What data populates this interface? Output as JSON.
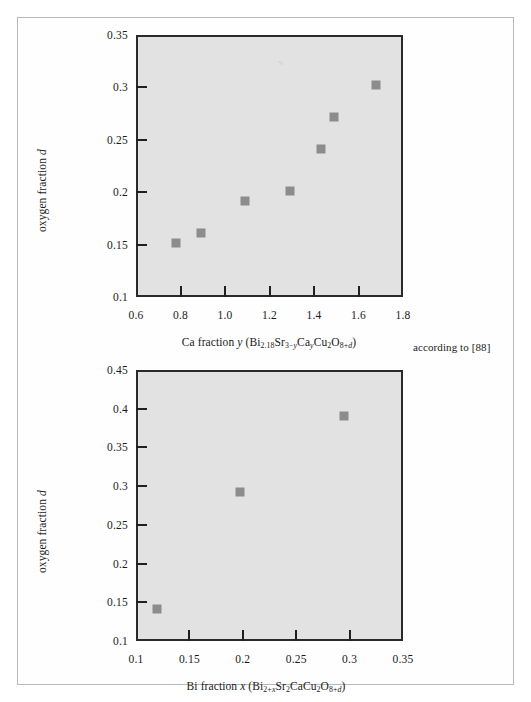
{
  "page": {
    "source_note": "according to [88]"
  },
  "charts": [
    {
      "id": "ca-fraction-plot",
      "axis_x_title_plain": "Ca fraction y (Bi2.18Sr3-yCayCu2O8+d)",
      "axis_y_title_plain": "oxygen fraction d",
      "x_ticks": [
        "0.6",
        "0.8",
        "1.0",
        "1.2",
        "1.4",
        "1.6",
        "1.8"
      ],
      "y_ticks": [
        "0.1",
        "0.15",
        "0.2",
        "0.25",
        "0.3",
        "0.35"
      ]
    },
    {
      "id": "bi-fraction-plot",
      "axis_x_title_plain": "Bi fraction x (Bi2+xSr2CaCu2O8+d)",
      "axis_y_title_plain": "oxygen fraction d",
      "x_ticks": [
        "0.1",
        "0.15",
        "0.2",
        "0.25",
        "0.3",
        "0.35"
      ],
      "y_ticks": [
        "0.1",
        "0.15",
        "0.2",
        "0.25",
        "0.3",
        "0.35",
        "0.4",
        "0.45"
      ]
    }
  ],
  "chart_data": [
    {
      "type": "scatter",
      "title": "",
      "xlabel": "Ca fraction y (Bi2.18Sr3-yCayCu2O8+d)",
      "ylabel": "oxygen fraction d",
      "xlim": [
        0.6,
        1.8
      ],
      "ylim": [
        0.1,
        0.35
      ],
      "xticks": [
        0.6,
        0.8,
        1.0,
        1.2,
        1.4,
        1.6,
        1.8
      ],
      "yticks": [
        0.1,
        0.15,
        0.2,
        0.25,
        0.3,
        0.35
      ],
      "grid": false,
      "legend": false,
      "marker": "square",
      "marker_color": "#8c8c8c",
      "plot_bg": "#e2e2e2",
      "points": [
        {
          "x": 0.78,
          "y": 0.152
        },
        {
          "x": 0.89,
          "y": 0.161
        },
        {
          "x": 1.09,
          "y": 0.192
        },
        {
          "x": 1.29,
          "y": 0.201
        },
        {
          "x": 1.43,
          "y": 0.241
        },
        {
          "x": 1.49,
          "y": 0.272
        },
        {
          "x": 1.68,
          "y": 0.302
        }
      ]
    },
    {
      "type": "scatter",
      "title": "",
      "xlabel": "Bi fraction x (Bi2+xSr2CaCu2O8+d)",
      "ylabel": "oxygen fraction d",
      "xlim": [
        0.1,
        0.35
      ],
      "ylim": [
        0.1,
        0.45
      ],
      "xticks": [
        0.1,
        0.15,
        0.2,
        0.25,
        0.3,
        0.35
      ],
      "yticks": [
        0.1,
        0.15,
        0.2,
        0.25,
        0.3,
        0.35,
        0.4,
        0.45
      ],
      "grid": false,
      "legend": false,
      "marker": "square",
      "marker_color": "#8c8c8c",
      "plot_bg": "#e2e2e2",
      "points": [
        {
          "x": 0.12,
          "y": 0.141
        },
        {
          "x": 0.197,
          "y": 0.292
        },
        {
          "x": 0.295,
          "y": 0.391
        }
      ]
    }
  ]
}
